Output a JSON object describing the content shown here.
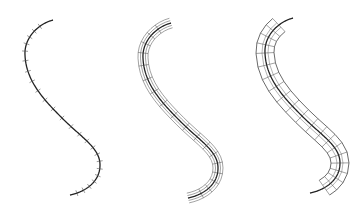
{
  "figure": {
    "panels": [
      {
        "name": "curve-with-ticks",
        "description": "S-shaped curve with perpendicular tick marks"
      },
      {
        "name": "ribbon-mesh",
        "description": "S-curve with thin wireframe ribbon/tube"
      },
      {
        "name": "tube-mesh",
        "description": "S-curve with wider wireframe tube made of quad segments"
      }
    ],
    "colors": {
      "stroke": "#222222",
      "mesh": "#444444",
      "background": "#ffffff"
    }
  }
}
